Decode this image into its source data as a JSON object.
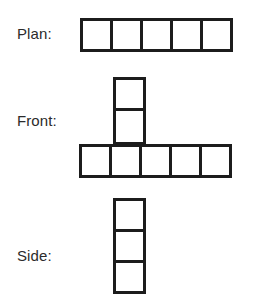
{
  "diagram": {
    "type": "orthographic-views",
    "background_color": "#ffffff",
    "stroke_color": "#1c1c1c",
    "fill_color": "#ffffff",
    "label_color": "#2b2b2b",
    "views": [
      {
        "key": "plan",
        "label": "Plan:",
        "shape": "horizontal-row",
        "cell_count": 5,
        "rows": 1,
        "columns": 5,
        "cells": [
          "1",
          "2",
          "3",
          "4",
          "5"
        ]
      },
      {
        "key": "front",
        "label": "Front:",
        "shape": "t-shape",
        "cell_count": 7,
        "base_row_cells": 5,
        "stem_column_cells": 2,
        "stem_over_base_cell_index": 2,
        "base_cells": [
          "1",
          "2",
          "3",
          "4",
          "5"
        ],
        "stem_cells": [
          "1",
          "2"
        ]
      },
      {
        "key": "side",
        "label": "Side:",
        "shape": "vertical-column",
        "cell_count": 3,
        "rows": 3,
        "columns": 1,
        "cells": [
          "1",
          "2",
          "3"
        ]
      }
    ]
  }
}
